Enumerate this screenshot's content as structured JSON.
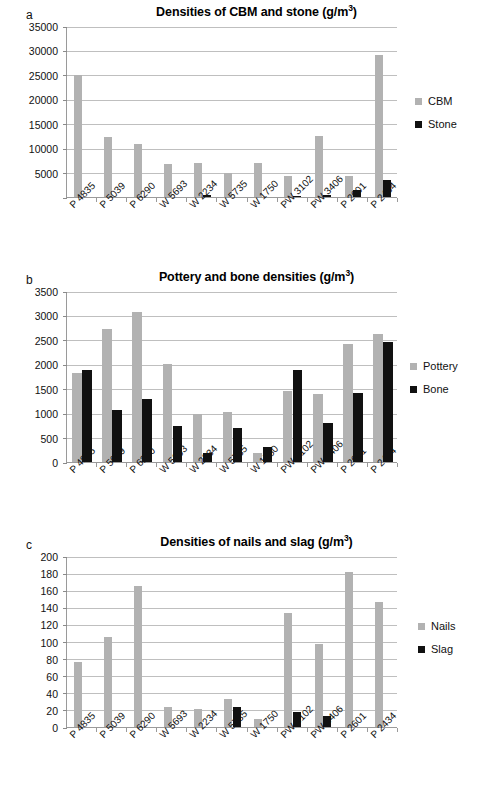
{
  "figure": {
    "panels": [
      "a",
      "b",
      "c"
    ]
  },
  "chart_data": [
    {
      "type": "bar",
      "panel": "a",
      "title": "Densities of CBM and stone (g/m",
      "title_sup": "3",
      "title_suffix": ")",
      "title_full": "Densities of CBM and stone (g/m3)",
      "xlabel": "",
      "ylabel": "",
      "ylim": [
        0,
        35000
      ],
      "ytick_step": 5000,
      "yticks": [
        0,
        5000,
        10000,
        15000,
        20000,
        25000,
        30000,
        35000
      ],
      "ytick_labels": [
        "",
        "5000",
        "10000",
        "15000",
        "20000",
        "25000",
        "30000",
        "35000"
      ],
      "grid": true,
      "legend_position": "right",
      "categories": [
        "P 4835",
        "P 5039",
        "P 6290",
        "W 5693",
        "W 2234",
        "W 5735",
        "W 1750",
        "PW 3102",
        "PW 3406",
        "P 2601",
        "P 2434"
      ],
      "series": [
        {
          "name": "CBM",
          "color": "#b2b2b2",
          "values": [
            24900,
            12200,
            10800,
            6700,
            6900,
            4900,
            7000,
            4400,
            12500,
            4400,
            29000
          ]
        },
        {
          "name": "Stone",
          "color": "#111111",
          "values": [
            0,
            0,
            0,
            0,
            400,
            0,
            0,
            200,
            450,
            1500,
            3400
          ]
        }
      ]
    },
    {
      "type": "bar",
      "panel": "b",
      "title": "Pottery and bone densities (g/m",
      "title_sup": "3",
      "title_suffix": ")",
      "title_full": "Pottery and bone densities (g/m3)",
      "xlabel": "",
      "ylabel": "",
      "ylim": [
        0,
        3500
      ],
      "ytick_step": 500,
      "yticks": [
        0,
        500,
        1000,
        1500,
        2000,
        2500,
        3000,
        3500
      ],
      "ytick_labels": [
        "0",
        "500",
        "1000",
        "1500",
        "2000",
        "2500",
        "3000",
        "3500"
      ],
      "grid": true,
      "legend_position": "right",
      "categories": [
        "P 4835",
        "P 5039",
        "P 6290",
        "W 5693",
        "W 2234",
        "W 5735",
        "W 1750",
        "PW 3102",
        "PW 3406",
        "P 2601",
        "P 2434"
      ],
      "series": [
        {
          "name": "Pottery",
          "color": "#b2b2b2",
          "values": [
            1830,
            2730,
            3070,
            2010,
            980,
            1020,
            190,
            1460,
            1390,
            2410,
            2630
          ]
        },
        {
          "name": "Bone",
          "color": "#111111",
          "values": [
            1880,
            1070,
            1300,
            740,
            180,
            700,
            300,
            1890,
            800,
            1420,
            2460
          ]
        }
      ]
    },
    {
      "type": "bar",
      "panel": "c",
      "title": "Densities of nails and slag (g/m",
      "title_sup": "3",
      "title_suffix": ")",
      "title_full": "Densities of nails and slag (g/m3)",
      "xlabel": "",
      "ylabel": "",
      "ylim": [
        0,
        200
      ],
      "ytick_step": 20,
      "yticks": [
        0,
        20,
        40,
        60,
        80,
        100,
        120,
        140,
        160,
        180,
        200
      ],
      "ytick_labels": [
        "0",
        "20",
        "40",
        "60",
        "80",
        "100",
        "120",
        "140",
        "160",
        "180",
        "200"
      ],
      "grid": true,
      "legend_position": "right",
      "categories": [
        "P 4835",
        "P 5039",
        "P 6290",
        "W 5693",
        "W 2234",
        "W 5735",
        "W 1750",
        "PW 3102",
        "PW 3406",
        "P 2601",
        "P 2434"
      ],
      "series": [
        {
          "name": "Nails",
          "color": "#b2b2b2",
          "values": [
            76,
            105,
            165,
            23,
            21,
            33,
            9,
            133,
            97,
            181,
            146
          ]
        },
        {
          "name": "Slag",
          "color": "#111111",
          "values": [
            0,
            0,
            0,
            0,
            0,
            23,
            0,
            18,
            13,
            0,
            0
          ]
        }
      ]
    }
  ]
}
